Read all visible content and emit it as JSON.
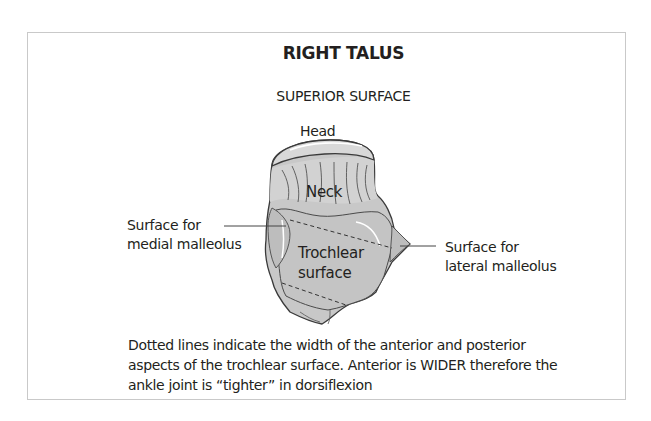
{
  "diagram": {
    "title": "RIGHT TALUS",
    "subtitle": "SUPERIOR SURFACE",
    "labels": {
      "head": "Head",
      "neck": "Neck",
      "trochlear_line1": "Trochlear",
      "trochlear_line2": "surface",
      "medial_line1": "Surface for",
      "medial_line2": "medial malleolus",
      "lateral_line1": "Surface for",
      "lateral_line2": "lateral malleolus"
    },
    "note": {
      "line1": "Dotted lines indicate the width of the anterior and posterior",
      "line2": "aspects of the trochlear surface. Anterior is WIDER therefore the",
      "line3": "ankle joint is “tighter” in dorsiflexion"
    },
    "colors": {
      "bone_fill": "#c8c8c8",
      "bone_fill_light": "#d6d6d6",
      "outline": "#3a3a3a",
      "panel_border": "#c9c9c9",
      "text": "#231f20"
    }
  }
}
